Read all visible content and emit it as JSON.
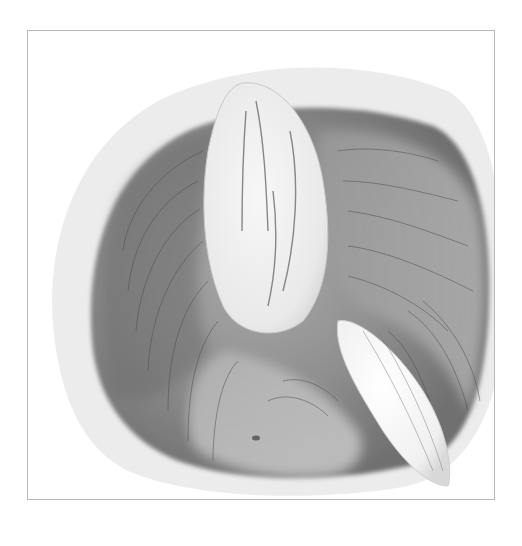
{
  "image": {
    "subject": "ceramic-bowl-with-two-leaf-shapes",
    "caption": "",
    "colors": {
      "background": "#ffffff",
      "frame_border": "#b8b8b8",
      "bowl_rim": "#ececec",
      "bowl_inner_dark": "#7a7a7a",
      "bowl_inner_mid": "#9c9c9c",
      "bowl_inner_light": "#c4c4c4",
      "leaf_light": "#f2f2f2",
      "crack_lines": "#4a4a4a"
    }
  }
}
